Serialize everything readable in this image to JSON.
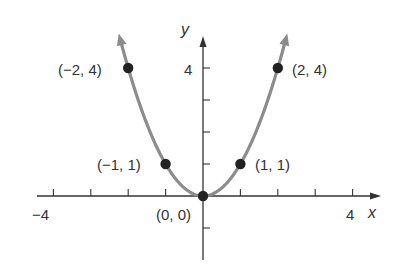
{
  "chart_data": {
    "type": "line",
    "title": "",
    "function": "y = x^2",
    "xlabel": "x",
    "ylabel": "y",
    "xlim": [
      -4.5,
      4.8
    ],
    "ylim": [
      -2,
      5
    ],
    "grid": false,
    "legend": null,
    "x_ticks": [
      -4,
      -3,
      -2,
      -1,
      1,
      2,
      3,
      4
    ],
    "x_tick_labels": {
      "-4": "−4",
      "4": "4"
    },
    "y_ticks": [
      -1,
      1,
      2,
      3,
      4
    ],
    "y_tick_labels": {
      "4": "4"
    },
    "series": [
      {
        "name": "y = x^2",
        "color": "#8c8c8c",
        "x": [
          -2.2,
          -2,
          -1,
          0,
          1,
          2,
          2.2
        ],
        "y": [
          4.84,
          4,
          1,
          0,
          1,
          4,
          4.84
        ],
        "arrows_at_ends": true
      }
    ],
    "points": [
      {
        "x": -2,
        "y": 4,
        "label": "(−2, 4)"
      },
      {
        "x": -1,
        "y": 1,
        "label": "(−1, 1)"
      },
      {
        "x": 0,
        "y": 0,
        "label": "(0, 0)"
      },
      {
        "x": 1,
        "y": 1,
        "label": "(1, 1)"
      },
      {
        "x": 2,
        "y": 4,
        "label": "(2, 4)"
      }
    ],
    "colors": {
      "axis": "#333333",
      "curve": "#8c8c8c",
      "point": "#222222"
    }
  },
  "labels": {
    "x_axis": "x",
    "y_axis": "y",
    "x_min_tick": "−4",
    "x_max_tick": "4",
    "y_max_tick": "4",
    "pt_neg2": "(−2, 4)",
    "pt_pos2": "(2, 4)",
    "pt_neg1": "(−1, 1)",
    "pt_pos1": "(1, 1)",
    "pt_origin": "(0, 0)"
  }
}
